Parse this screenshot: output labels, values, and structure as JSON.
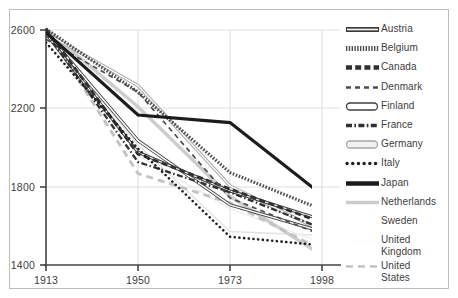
{
  "chart_data": {
    "type": "line",
    "title": "",
    "subtitle": "",
    "xlabel": "",
    "ylabel": "",
    "x": [
      "1913",
      "1950",
      "1973",
      "1998"
    ],
    "xtick_labels": [
      "1913",
      "1950",
      "1973",
      "1998"
    ],
    "ytick_labels": [
      "1400",
      "1800",
      "2200",
      "2600"
    ],
    "yticks": [
      1400,
      1800,
      2200,
      2600
    ],
    "ylim": [
      1400,
      2600
    ],
    "grid": true,
    "legend_position": "right",
    "series": [
      {
        "name": "Austria",
        "values": [
          2580,
          1976,
          1778,
          1631
        ],
        "style": "thick-outline",
        "color": "#3a3a3a"
      },
      {
        "name": "Belgium",
        "values": [
          2605,
          2283,
          1872,
          1683
        ],
        "style": "hatched",
        "color": "#4a4a4a"
      },
      {
        "name": "Canada",
        "values": [
          2605,
          1967,
          1788,
          1617
        ],
        "style": "thick-dash",
        "color": "#2e2e2e"
      },
      {
        "name": "Denmark",
        "values": [
          2553,
          2283,
          1742,
          1552
        ],
        "style": "thin-dash",
        "color": "#4a4a4a"
      },
      {
        "name": "Finland",
        "values": [
          2588,
          2035,
          1707,
          1570
        ],
        "style": "hollow-bar",
        "color": "#3a3a3a"
      },
      {
        "name": "France",
        "values": [
          2588,
          1926,
          1771,
          1587
        ],
        "style": "dash-dot",
        "color": "#2e2e2e"
      },
      {
        "name": "Germany",
        "values": [
          2584,
          2316,
          1804,
          1574
        ],
        "style": "hollow-light",
        "color": "#9a9a9a"
      },
      {
        "name": "Italy",
        "values": [
          2536,
          1994,
          1544,
          1500
        ],
        "style": "dotted",
        "color": "#1f1f1f"
      },
      {
        "name": "Japan",
        "values": [
          2588,
          2166,
          2127,
          1758
        ],
        "style": "thick-solid",
        "color": "#1a1a1a"
      },
      {
        "name": "Netherlands",
        "values": [
          2605,
          2208,
          1751,
          1449
        ],
        "style": "light-solid",
        "color": "#c8c8c8"
      },
      {
        "name": "Sweden",
        "values": [
          2588,
          2014,
          1571,
          1551
        ],
        "style": "white-thin",
        "color": "#e0e0e0"
      },
      {
        "name": "United Kingdom",
        "values": [
          2624,
          1958,
          1688,
          1513
        ],
        "style": "white-thin",
        "color": "#ededed"
      },
      {
        "name": "United States",
        "values": [
          2605,
          1867,
          1717,
          1476
        ],
        "style": "light-dash",
        "color": "#bfbfbf"
      }
    ]
  },
  "legend": {
    "items": [
      {
        "label": "Austria"
      },
      {
        "label": "Belgium"
      },
      {
        "label": "Canada"
      },
      {
        "label": "Denmark"
      },
      {
        "label": "Finland"
      },
      {
        "label": "France"
      },
      {
        "label": "Germany"
      },
      {
        "label": "Italy"
      },
      {
        "label": "Japan"
      },
      {
        "label": "Netherlands"
      },
      {
        "label": "Sweden"
      },
      {
        "label": "United\nKingdom"
      },
      {
        "label": "United\nStates"
      }
    ]
  },
  "axes": {
    "y_labels": [
      "2600",
      "2200",
      "1800",
      "1400"
    ],
    "x_labels": [
      "1913",
      "1950",
      "1973",
      "1998"
    ]
  }
}
